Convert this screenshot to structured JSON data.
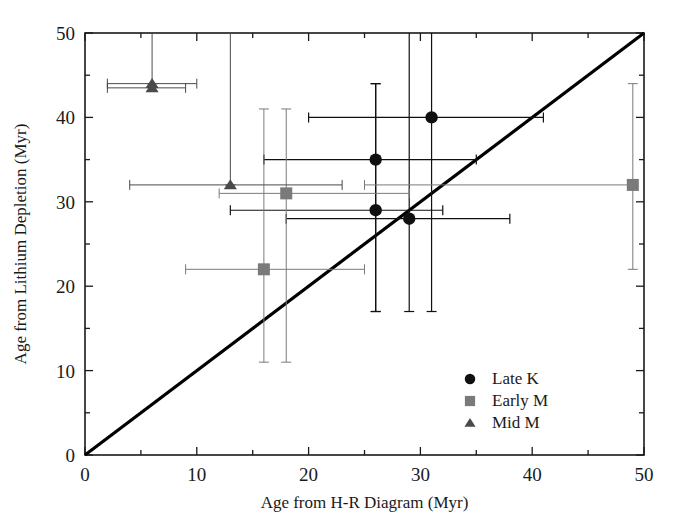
{
  "chart_data": {
    "type": "scatter",
    "title": "",
    "xlabel": "Age from H-R Diagram (Myr)",
    "ylabel": "Age from Lithium Depletion (Myr)",
    "xlim": [
      0,
      50
    ],
    "ylim": [
      0,
      50
    ],
    "xticks_major": [
      0,
      10,
      20,
      30,
      40,
      50
    ],
    "yticks_major": [
      0,
      10,
      20,
      30,
      40,
      50
    ],
    "xticks_minor": [
      5,
      15,
      25,
      35,
      45
    ],
    "yticks_minor": [
      5,
      15,
      25,
      35,
      45
    ],
    "xticklabels": [
      "0",
      "10",
      "20",
      "30",
      "40",
      "50"
    ],
    "yticklabels": [
      "0",
      "10",
      "20",
      "30",
      "40",
      "50"
    ],
    "grid": false,
    "reference_line": {
      "label": "one-to-one line",
      "from": [
        0,
        0
      ],
      "to": [
        50,
        50
      ],
      "color": "#000000"
    },
    "legend": {
      "position": "bottom-right",
      "entries": [
        {
          "label": "Late K",
          "marker": "circle",
          "color": "#101010"
        },
        {
          "label": "Early M",
          "marker": "square",
          "color": "#7a7a7a"
        },
        {
          "label": "Mid M",
          "marker": "triangle",
          "color": "#4a4a4a"
        }
      ]
    },
    "series": [
      {
        "name": "Late K",
        "marker": "circle",
        "color": "#101010",
        "points": [
          {
            "x": 31,
            "y": 40,
            "xerr_lo": 20,
            "xerr_hi": 41,
            "yerr_lo": 17,
            "yerr_hi": 50
          },
          {
            "x": 26,
            "y": 35,
            "xerr_lo": 16,
            "xerr_hi": 35,
            "yerr_lo": 17,
            "yerr_hi": 44
          },
          {
            "x": 26,
            "y": 29,
            "xerr_lo": 13,
            "xerr_hi": 32,
            "yerr_lo": 17,
            "yerr_hi": 44
          },
          {
            "x": 29,
            "y": 28,
            "xerr_lo": 18,
            "xerr_hi": 38,
            "yerr_lo": 17,
            "yerr_hi": 50
          }
        ]
      },
      {
        "name": "Early M",
        "marker": "square",
        "color": "#7a7a7a",
        "points": [
          {
            "x": 18,
            "y": 31,
            "xerr_lo": 12,
            "xerr_hi": 29,
            "yerr_lo": 11,
            "yerr_hi": 41
          },
          {
            "x": 16,
            "y": 22,
            "xerr_lo": 9,
            "xerr_hi": 25,
            "yerr_lo": 11,
            "yerr_hi": 41
          },
          {
            "x": 49,
            "y": 32,
            "xerr_lo": 25,
            "xerr_hi": 49,
            "yerr_lo": 22,
            "yerr_hi": 44
          }
        ]
      },
      {
        "name": "Mid M",
        "marker": "triangle",
        "color": "#4a4a4a",
        "points": [
          {
            "x": 6,
            "y": 44,
            "xerr_lo": 2,
            "xerr_hi": 10,
            "yerr_lo": 44,
            "yerr_hi": 50
          },
          {
            "x": 6,
            "y": 43.5,
            "xerr_lo": 2,
            "xerr_hi": 9,
            "yerr_lo": 43.5,
            "yerr_hi": 43.5
          },
          {
            "x": 13,
            "y": 32,
            "xerr_lo": 4,
            "xerr_hi": 23,
            "yerr_lo": 32,
            "yerr_hi": 50
          }
        ]
      }
    ]
  },
  "figure": {
    "axis_color": "#1a1a1a",
    "background": "#ffffff"
  }
}
